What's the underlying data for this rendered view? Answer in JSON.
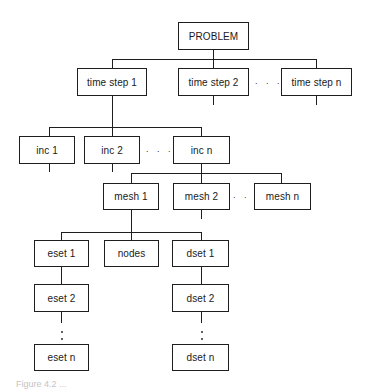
{
  "diagram": {
    "type": "hierarchy-tree",
    "root": {
      "label": "PROBLEM"
    },
    "time_steps": [
      {
        "label": "time step 1"
      },
      {
        "label": "time step 2"
      },
      {
        "label": "time step n"
      }
    ],
    "increments": [
      {
        "label": "inc 1"
      },
      {
        "label": "inc 2"
      },
      {
        "label": "inc n"
      }
    ],
    "meshes": [
      {
        "label": "mesh 1"
      },
      {
        "label": "mesh 2"
      },
      {
        "label": "mesh n"
      }
    ],
    "mesh_children": {
      "esets": [
        {
          "label": "eset 1"
        },
        {
          "label": "eset 2"
        },
        {
          "label": "eset n"
        }
      ],
      "nodes": {
        "label": "nodes"
      },
      "dsets": [
        {
          "label": "dset 1"
        },
        {
          "label": "dset 2"
        },
        {
          "label": "dset n"
        }
      ]
    },
    "ellipsis": ". . .",
    "edges": [
      [
        "PROBLEM",
        "time step 1"
      ],
      [
        "PROBLEM",
        "time step 2"
      ],
      [
        "PROBLEM",
        "time step n"
      ],
      [
        "time step 1",
        "inc 1"
      ],
      [
        "time step 1",
        "inc 2"
      ],
      [
        "time step 1",
        "inc n"
      ],
      [
        "inc n",
        "mesh 1"
      ],
      [
        "inc n",
        "mesh 2"
      ],
      [
        "inc n",
        "mesh n"
      ],
      [
        "mesh 1",
        "eset 1"
      ],
      [
        "mesh 1",
        "nodes"
      ],
      [
        "mesh 1",
        "dset 1"
      ],
      [
        "eset 1",
        "eset 2"
      ],
      [
        "eset 2",
        "eset n"
      ],
      [
        "dset 1",
        "dset 2"
      ],
      [
        "dset 2",
        "dset n"
      ]
    ]
  },
  "caption": "Figure 4.2 ..."
}
